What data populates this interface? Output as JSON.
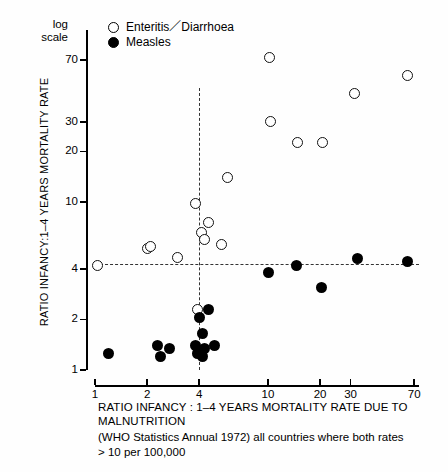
{
  "chart_data": {
    "type": "scatter",
    "title": "",
    "xlabel": "RATIO INFANCY : 1–4 YEARS MORTALITY RATE DUE TO MALNUTRITION",
    "ylabel": "RATIO INFANCY : 1–4 YEARS MORTALITY RATE",
    "note": "(WHO Statistics Annual 1972) all countries where both rates > 10 per 100,000",
    "scale_note": "log scale",
    "xscale": "log",
    "yscale": "log",
    "xlim": [
      1,
      70
    ],
    "ylim": [
      1,
      70
    ],
    "grid": false,
    "legend_position": "top-left inside",
    "x_ticks": [
      {
        "label": "1",
        "value": 1
      },
      {
        "label": "2",
        "value": 2
      },
      {
        "label": "4",
        "value": 4
      },
      {
        "label": "10",
        "value": 10
      },
      {
        "label": "20",
        "value": 20
      },
      {
        "label": "30",
        "value": 30
      },
      {
        "label": "70",
        "value": 70
      }
    ],
    "y_ticks": [
      {
        "label": "70",
        "value": 70
      },
      {
        "label": "30",
        "value": 30
      },
      {
        "label": "20",
        "value": 20
      },
      {
        "label": "10",
        "value": 10
      },
      {
        "label": "4",
        "value": 4
      },
      {
        "label": "2",
        "value": 2
      },
      {
        "label": "1",
        "value": 1
      }
    ],
    "reference_lines": [
      {
        "orientation": "horizontal",
        "value": 4.3,
        "style": "dashed"
      },
      {
        "orientation": "vertical",
        "value": 4.0,
        "style": "dashed"
      }
    ],
    "series": [
      {
        "name": "Enteritis / Diarrhoea",
        "marker": "open-circle",
        "color": "#000000",
        "points": [
          {
            "x": 1.03,
            "y": 4.2
          },
          {
            "x": 2.0,
            "y": 5.3
          },
          {
            "x": 2.1,
            "y": 5.4
          },
          {
            "x": 3.0,
            "y": 4.7
          },
          {
            "x": 3.8,
            "y": 9.8
          },
          {
            "x": 4.1,
            "y": 6.6
          },
          {
            "x": 4.3,
            "y": 6.0
          },
          {
            "x": 4.5,
            "y": 7.6
          },
          {
            "x": 3.9,
            "y": 2.3
          },
          {
            "x": 5.4,
            "y": 5.6
          },
          {
            "x": 5.8,
            "y": 14.0
          },
          {
            "x": 10.2,
            "y": 72.0
          },
          {
            "x": 10.3,
            "y": 30.0
          },
          {
            "x": 14.8,
            "y": 22.5
          },
          {
            "x": 20.6,
            "y": 22.5
          },
          {
            "x": 31.5,
            "y": 44.0
          },
          {
            "x": 64.0,
            "y": 57.0
          }
        ]
      },
      {
        "name": "Measles",
        "marker": "filled-circle",
        "color": "#000000",
        "points": [
          {
            "x": 1.2,
            "y": 1.25
          },
          {
            "x": 2.3,
            "y": 1.4
          },
          {
            "x": 2.4,
            "y": 1.2
          },
          {
            "x": 2.7,
            "y": 1.35
          },
          {
            "x": 4.0,
            "y": 2.05
          },
          {
            "x": 4.5,
            "y": 2.3
          },
          {
            "x": 4.2,
            "y": 1.65
          },
          {
            "x": 3.9,
            "y": 1.25
          },
          {
            "x": 3.8,
            "y": 1.4
          },
          {
            "x": 4.3,
            "y": 1.35
          },
          {
            "x": 4.2,
            "y": 1.2
          },
          {
            "x": 4.9,
            "y": 1.4
          },
          {
            "x": 10.1,
            "y": 3.8
          },
          {
            "x": 14.6,
            "y": 4.2
          },
          {
            "x": 20.4,
            "y": 3.1
          },
          {
            "x": 33.0,
            "y": 4.6
          },
          {
            "x": 64.0,
            "y": 4.4
          }
        ]
      }
    ]
  },
  "legend": {
    "items": [
      {
        "label": "Enteritis／Diarrhoea",
        "marker": "open-circle"
      },
      {
        "label": "Measles",
        "marker": "filled-circle"
      }
    ]
  },
  "axis": {
    "log_scale_label": "log\nscale",
    "log_scale_line1": "log",
    "log_scale_line2": "scale",
    "y_title": "RATIO INFANCY:1–4 YEARS MORTALITY RATE",
    "x_title": "RATIO INFANCY : 1–4 YEARS MORTALITY RATE DUE TO MALNUTRITION",
    "x_note_line1": "(WHO Statistics Annual 1972) all countries where both rates",
    "x_note_line2": "> 10 per 100,000"
  }
}
